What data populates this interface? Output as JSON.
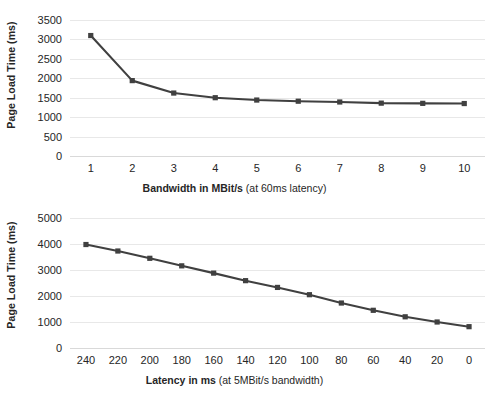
{
  "chart_data": [
    {
      "id": "bandwidth-chart",
      "type": "line",
      "title": "",
      "xlabel_bold": "Bandwidth in MBit/s",
      "xlabel_plain": "(at 60ms latency)",
      "ylabel": "Page Load Time (ms)",
      "x": [
        1,
        2,
        3,
        4,
        5,
        6,
        7,
        8,
        9,
        10
      ],
      "categories": [
        "1",
        "2",
        "3",
        "4",
        "5",
        "6",
        "7",
        "8",
        "9",
        "10"
      ],
      "values": [
        3100,
        1940,
        1620,
        1500,
        1440,
        1410,
        1390,
        1360,
        1355,
        1350
      ],
      "ylim": [
        0,
        3500
      ],
      "yticks": [
        0,
        500,
        1000,
        1500,
        2000,
        2500,
        3000,
        3500
      ],
      "ytick_labels": [
        "0",
        "500",
        "1000",
        "1500",
        "2000",
        "2500",
        "3000",
        "3500"
      ],
      "grid": true,
      "legend": "none",
      "line_color": "#404040",
      "marker_color": "#404040",
      "marker": "square"
    },
    {
      "id": "latency-chart",
      "type": "line",
      "title": "",
      "xlabel_bold": "Latency in ms",
      "xlabel_plain": "(at 5MBit/s bandwidth)",
      "ylabel": "Page Load Time (ms)",
      "x": [
        240,
        220,
        200,
        180,
        160,
        140,
        120,
        100,
        80,
        60,
        40,
        20,
        0
      ],
      "categories": [
        "240",
        "220",
        "200",
        "180",
        "160",
        "140",
        "120",
        "100",
        "80",
        "60",
        "40",
        "20",
        "0"
      ],
      "values": [
        3980,
        3730,
        3450,
        3160,
        2880,
        2590,
        2330,
        2050,
        1730,
        1450,
        1200,
        1000,
        820
      ],
      "ylim": [
        0,
        5000
      ],
      "yticks": [
        0,
        1000,
        2000,
        3000,
        4000,
        5000
      ],
      "ytick_labels": [
        "0",
        "1000",
        "2000",
        "3000",
        "4000",
        "5000"
      ],
      "grid": true,
      "legend": "none",
      "line_color": "#404040",
      "marker_color": "#404040",
      "marker": "square"
    }
  ],
  "colors": {
    "series": "#404040",
    "gridline": "#e8e8e8",
    "text": "#262626",
    "background": "#ffffff"
  }
}
